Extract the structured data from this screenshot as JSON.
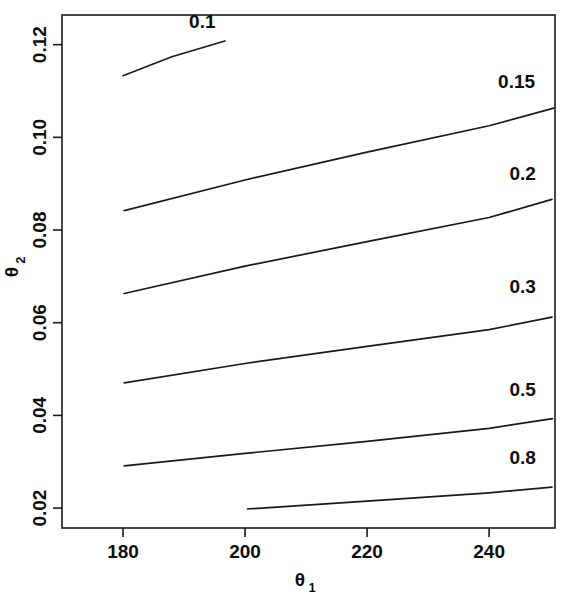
{
  "chart_data": {
    "type": "line",
    "subtype": "contour",
    "title": "",
    "xlabel": "θ₁",
    "ylabel": "θ₂",
    "xlim": [
      170.0,
      250.8
    ],
    "ylim": [
      0.0157,
      0.1264
    ],
    "xticks": [
      180,
      200,
      220,
      240
    ],
    "xtick_labels": [
      "180",
      "200",
      "220",
      "240"
    ],
    "yticks": [
      0.02,
      0.04,
      0.06,
      0.08,
      0.1,
      0.12
    ],
    "ytick_labels": [
      "0.02",
      "0.04",
      "0.06",
      "0.08",
      "0.10",
      "0.12"
    ],
    "grid": false,
    "legend": "none",
    "frame": "box",
    "line_color": "#1a1a1a",
    "contours": [
      {
        "level": 0.1,
        "label": "0.1",
        "label_x": 193.0,
        "label_y": 0.1235,
        "points": [
          {
            "x": 180.0,
            "y": 0.1133
          },
          {
            "x": 188.0,
            "y": 0.1174
          },
          {
            "x": 196.7,
            "y": 0.1208
          }
        ]
      },
      {
        "level": 0.15,
        "label": "0.15",
        "label_x": 244.5,
        "label_y": 0.1106,
        "points": [
          {
            "x": 180.2,
            "y": 0.0842
          },
          {
            "x": 200.0,
            "y": 0.0908
          },
          {
            "x": 220.0,
            "y": 0.0968
          },
          {
            "x": 240.0,
            "y": 0.1025
          },
          {
            "x": 250.6,
            "y": 0.1063
          }
        ]
      },
      {
        "level": 0.2,
        "label": "0.2",
        "label_x": 245.5,
        "label_y": 0.0909,
        "points": [
          {
            "x": 180.2,
            "y": 0.0663
          },
          {
            "x": 200.0,
            "y": 0.0722
          },
          {
            "x": 220.0,
            "y": 0.0775
          },
          {
            "x": 240.0,
            "y": 0.0827
          },
          {
            "x": 250.3,
            "y": 0.0866
          }
        ]
      },
      {
        "level": 0.3,
        "label": "0.3",
        "label_x": 245.5,
        "label_y": 0.0665,
        "points": [
          {
            "x": 180.2,
            "y": 0.047
          },
          {
            "x": 200.0,
            "y": 0.0512
          },
          {
            "x": 220.0,
            "y": 0.0549
          },
          {
            "x": 240.0,
            "y": 0.0585
          },
          {
            "x": 250.3,
            "y": 0.0612
          }
        ]
      },
      {
        "level": 0.5,
        "label": "0.5",
        "label_x": 245.5,
        "label_y": 0.0442,
        "points": [
          {
            "x": 180.2,
            "y": 0.0291
          },
          {
            "x": 200.0,
            "y": 0.0318
          },
          {
            "x": 220.0,
            "y": 0.0344
          },
          {
            "x": 240.0,
            "y": 0.0372
          },
          {
            "x": 250.4,
            "y": 0.0393
          }
        ]
      },
      {
        "level": 0.8,
        "label": "0.8",
        "label_x": 245.5,
        "label_y": 0.0296,
        "points": [
          {
            "x": 200.4,
            "y": 0.0198
          },
          {
            "x": 220.0,
            "y": 0.0215
          },
          {
            "x": 240.0,
            "y": 0.0233
          },
          {
            "x": 250.3,
            "y": 0.0245
          }
        ]
      }
    ]
  },
  "axes": {
    "x_title_main": "θ",
    "x_title_sub": "1",
    "y_title_main": "θ",
    "y_title_sub": "2"
  }
}
